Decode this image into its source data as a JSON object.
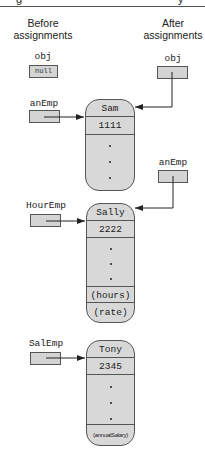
{
  "header": {
    "fragment_left": "g",
    "fragment_right": "y"
  },
  "columns": {
    "before": "Before assignments",
    "before_line1": "Before",
    "before_line2": "assignments",
    "after_line1": "After",
    "after_line2": "assignments"
  },
  "variables": {
    "obj_before": {
      "label": "obj",
      "value": "null"
    },
    "obj_after": {
      "label": "obj"
    },
    "anEmp_before": {
      "label": "anEmp"
    },
    "anEmp_after": {
      "label": "anEmp"
    },
    "hourEmp": {
      "label": "HourEmp"
    },
    "salEmp": {
      "label": "SalEmp"
    }
  },
  "objects": [
    {
      "name": "Sam",
      "id": "1111",
      "extra": []
    },
    {
      "name": "Sally",
      "id": "2222",
      "extra": [
        "(hours)",
        "(rate)"
      ]
    },
    {
      "name": "Tony",
      "id": "2345",
      "extra": [
        "(annualSalary)"
      ]
    }
  ],
  "colors": {
    "fill": "#d8d8d8",
    "stroke": "#555555",
    "text": "#222222"
  }
}
